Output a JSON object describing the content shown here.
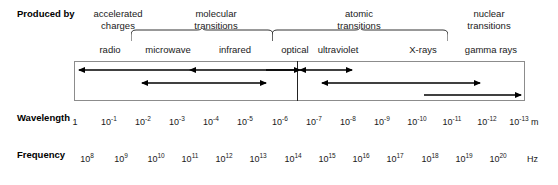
{
  "diagram": {
    "produced_by_label": "Produced by",
    "sources": [
      {
        "id": "accelerated-charges",
        "lines": [
          "accelerated",
          "charges"
        ],
        "x": 118,
        "top": 8
      },
      {
        "id": "molecular-transitions",
        "lines": [
          "molecular",
          "transitions"
        ],
        "x": 216,
        "top": 8
      },
      {
        "id": "atomic-transitions",
        "lines": [
          "atomic",
          "transitions"
        ],
        "x": 359,
        "top": 8
      },
      {
        "id": "nuclear-transitions",
        "lines": [
          "nuclear",
          "transitions"
        ],
        "x": 489,
        "top": 8
      }
    ],
    "bands": [
      {
        "id": "radio",
        "label": "radio",
        "x": 110
      },
      {
        "id": "microwave",
        "label": "microwave",
        "x": 168
      },
      {
        "id": "infrared",
        "label": "infrared",
        "x": 235
      },
      {
        "id": "optical",
        "label": "optical",
        "x": 295
      },
      {
        "id": "ultraviolet",
        "label": "ultraviolet",
        "x": 338
      },
      {
        "id": "x-rays",
        "label": "X-rays",
        "x": 423
      },
      {
        "id": "gamma-rays",
        "label": "gamma rays",
        "x": 491
      }
    ],
    "braces": [
      {
        "id": "molecular-brace",
        "left": 131,
        "right": 273,
        "y": 40
      },
      {
        "id": "atomic-brace",
        "left": 272,
        "right": 448,
        "y": 40
      }
    ],
    "box": {
      "left": 74,
      "top": 61,
      "width": 451,
      "height": 40,
      "divider_x": 297
    },
    "arrows": [
      {
        "id": "radio-arrow",
        "x1": 190,
        "x2": 79,
        "y": 70,
        "head": "left"
      },
      {
        "id": "microwave-arrow",
        "x1": 142,
        "x2": 266,
        "y": 83,
        "head": "both"
      },
      {
        "id": "infrared-arrow",
        "x1": 294,
        "x2": 190,
        "y": 70,
        "head": "left"
      },
      {
        "id": "optical-arrow",
        "x1": 300,
        "x2": 352,
        "y": 70,
        "head": "both"
      },
      {
        "id": "ultraviolet-arrow",
        "x1": 322,
        "x2": 480,
        "y": 83,
        "head": "both"
      },
      {
        "id": "gamma-arrow",
        "x1": 424,
        "x2": 521,
        "y": 95,
        "head": "right"
      },
      {
        "id": "xray-arrow",
        "x1": 266,
        "x2": 300,
        "y": 70,
        "head": "right"
      }
    ],
    "wavelength": {
      "label": "Wavelength",
      "unit": "m",
      "unit_x": 531,
      "y": 117,
      "ticks": [
        {
          "mantissa": "1",
          "exp": "",
          "x": 75
        },
        {
          "mantissa": "10",
          "exp": "-1",
          "x": 109
        },
        {
          "mantissa": "10",
          "exp": "-2",
          "x": 143
        },
        {
          "mantissa": "10",
          "exp": "-3",
          "x": 177
        },
        {
          "mantissa": "10",
          "exp": "-4",
          "x": 211
        },
        {
          "mantissa": "10",
          "exp": "-5",
          "x": 245
        },
        {
          "mantissa": "10",
          "exp": "-6",
          "x": 280
        },
        {
          "mantissa": "10",
          "exp": "-7",
          "x": 314
        },
        {
          "mantissa": "10",
          "exp": "-8",
          "x": 348
        },
        {
          "mantissa": "10",
          "exp": "-9",
          "x": 382
        },
        {
          "mantissa": "10",
          "exp": "-10",
          "x": 417
        },
        {
          "mantissa": "10",
          "exp": "-11",
          "x": 452
        },
        {
          "mantissa": "10",
          "exp": "-12",
          "x": 487
        },
        {
          "mantissa": "10",
          "exp": "-13",
          "x": 519
        }
      ]
    },
    "frequency": {
      "label": "Frequency",
      "unit": "Hz",
      "unit_x": 527,
      "y": 154,
      "ticks": [
        {
          "mantissa": "10",
          "exp": "8",
          "x": 87
        },
        {
          "mantissa": "10",
          "exp": "9",
          "x": 121
        },
        {
          "mantissa": "10",
          "exp": "10",
          "x": 156
        },
        {
          "mantissa": "10",
          "exp": "11",
          "x": 190
        },
        {
          "mantissa": "10",
          "exp": "12",
          "x": 224
        },
        {
          "mantissa": "10",
          "exp": "13",
          "x": 258
        },
        {
          "mantissa": "10",
          "exp": "14",
          "x": 293
        },
        {
          "mantissa": "10",
          "exp": "15",
          "x": 327
        },
        {
          "mantissa": "10",
          "exp": "16",
          "x": 361
        },
        {
          "mantissa": "10",
          "exp": "17",
          "x": 395
        },
        {
          "mantissa": "10",
          "exp": "18",
          "x": 430
        },
        {
          "mantissa": "10",
          "exp": "19",
          "x": 464
        },
        {
          "mantissa": "10",
          "exp": "20",
          "x": 498
        }
      ]
    },
    "colors": {
      "text": "#1a1a1a",
      "box_border": "#8c8c8c",
      "divider": "#222222",
      "arrow": "#000000",
      "background": "#ffffff"
    }
  }
}
